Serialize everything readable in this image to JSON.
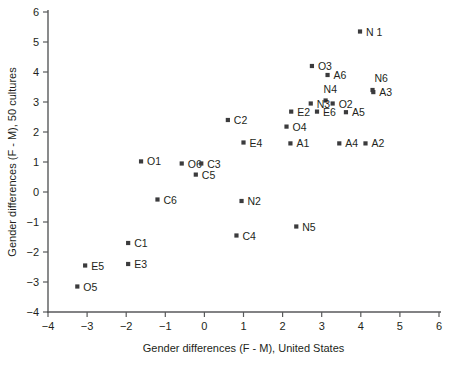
{
  "chart_data": {
    "type": "scatter",
    "title": "",
    "xlabel": "Gender differences (F - M), United States",
    "ylabel": "Gender differences (F - M), 50 cultures",
    "xlim": [
      -4,
      6
    ],
    "ylim": [
      -4,
      6
    ],
    "xticks": [
      -4,
      -3,
      -2,
      -1,
      0,
      1,
      2,
      3,
      4,
      5,
      6
    ],
    "xticklabels": [
      "−4",
      "−3",
      "−2",
      "−1",
      "0",
      "1",
      "2",
      "3",
      "4",
      "5",
      "6"
    ],
    "yticks": [
      -4,
      -3,
      -2,
      -1,
      0,
      1,
      2,
      3,
      4,
      5,
      6
    ],
    "yticklabels": [
      "−4",
      "−3",
      "−2",
      "−1",
      "0",
      "1",
      "2",
      "3",
      "4",
      "5",
      "6"
    ],
    "grid": false,
    "legend": false,
    "marker": "square",
    "marker_color": "#3b3b3d",
    "points": [
      {
        "label": "N 1",
        "x": 3.98,
        "y": 5.35,
        "lx": 6,
        "ly": 4
      },
      {
        "label": "O3",
        "x": 2.75,
        "y": 4.2,
        "lx": 6,
        "ly": 4
      },
      {
        "label": "A6",
        "x": 3.15,
        "y": 3.9,
        "lx": 6,
        "ly": 4
      },
      {
        "label": "N6",
        "x": 4.3,
        "y": 3.4,
        "lx": 2,
        "ly": -8
      },
      {
        "label": "A3",
        "x": 4.32,
        "y": 3.33,
        "lx": 6,
        "ly": 4
      },
      {
        "label": "N4",
        "x": 3.1,
        "y": 3.05,
        "lx": -2,
        "ly": -8
      },
      {
        "label": "N3",
        "x": 2.72,
        "y": 2.95,
        "lx": 6,
        "ly": 4
      },
      {
        "label": "O2",
        "x": 3.28,
        "y": 2.95,
        "lx": 6,
        "ly": 4
      },
      {
        "label": "E2",
        "x": 2.22,
        "y": 2.68,
        "lx": 6,
        "ly": 4
      },
      {
        "label": "E6",
        "x": 2.88,
        "y": 2.68,
        "lx": 6,
        "ly": 4
      },
      {
        "label": "A5",
        "x": 3.62,
        "y": 2.66,
        "lx": 6,
        "ly": 4
      },
      {
        "label": "C2",
        "x": 0.6,
        "y": 2.4,
        "lx": 6,
        "ly": 4
      },
      {
        "label": "O4",
        "x": 2.1,
        "y": 2.18,
        "lx": 6,
        "ly": 4
      },
      {
        "label": "E4",
        "x": 1.0,
        "y": 1.65,
        "lx": 6,
        "ly": 4
      },
      {
        "label": "A1",
        "x": 2.2,
        "y": 1.62,
        "lx": 6,
        "ly": 4
      },
      {
        "label": "A4",
        "x": 3.45,
        "y": 1.62,
        "lx": 6,
        "ly": 4
      },
      {
        "label": "A2",
        "x": 4.12,
        "y": 1.62,
        "lx": 6,
        "ly": 4
      },
      {
        "label": "O1",
        "x": -1.62,
        "y": 1.02,
        "lx": 6,
        "ly": 4
      },
      {
        "label": "O6",
        "x": -0.58,
        "y": 0.95,
        "lx": 6,
        "ly": 4
      },
      {
        "label": "C3",
        "x": -0.08,
        "y": 0.95,
        "lx": 6,
        "ly": 4
      },
      {
        "label": "C5",
        "x": -0.22,
        "y": 0.58,
        "lx": 6,
        "ly": 4
      },
      {
        "label": "C6",
        "x": -1.2,
        "y": -0.25,
        "lx": 6,
        "ly": 4
      },
      {
        "label": "N2",
        "x": 0.95,
        "y": -0.3,
        "lx": 6,
        "ly": 4
      },
      {
        "label": "N5",
        "x": 2.35,
        "y": -1.15,
        "lx": 6,
        "ly": 4
      },
      {
        "label": "C4",
        "x": 0.82,
        "y": -1.45,
        "lx": 6,
        "ly": 4
      },
      {
        "label": "C1",
        "x": -1.95,
        "y": -1.7,
        "lx": 6,
        "ly": 4
      },
      {
        "label": "E3",
        "x": -1.95,
        "y": -2.4,
        "lx": 6,
        "ly": 4
      },
      {
        "label": "E5",
        "x": -3.05,
        "y": -2.45,
        "lx": 6,
        "ly": 4
      },
      {
        "label": "O5",
        "x": -3.25,
        "y": -3.15,
        "lx": 6,
        "ly": 4
      }
    ]
  }
}
